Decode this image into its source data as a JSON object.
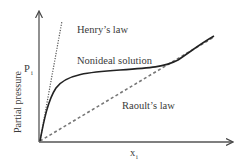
{
  "diagram": {
    "title": "",
    "y_axis_label": "Partial pressure",
    "y_symbol": "P",
    "y_symbol_sub": "i",
    "x_symbol": "x",
    "x_symbol_sub": "i",
    "curves": [
      {
        "name": "Henry's law",
        "style": "dotted",
        "label": "Henry’s law"
      },
      {
        "name": "Nonideal solution",
        "style": "solid",
        "label": "Nonideal solution"
      },
      {
        "name": "Raoult's law",
        "style": "dashed",
        "label": "Raoult’s law"
      }
    ],
    "colors": {
      "axis": "#555555",
      "curve": "#222222",
      "text": "#3a3a3a",
      "dashed": "#777777"
    }
  }
}
